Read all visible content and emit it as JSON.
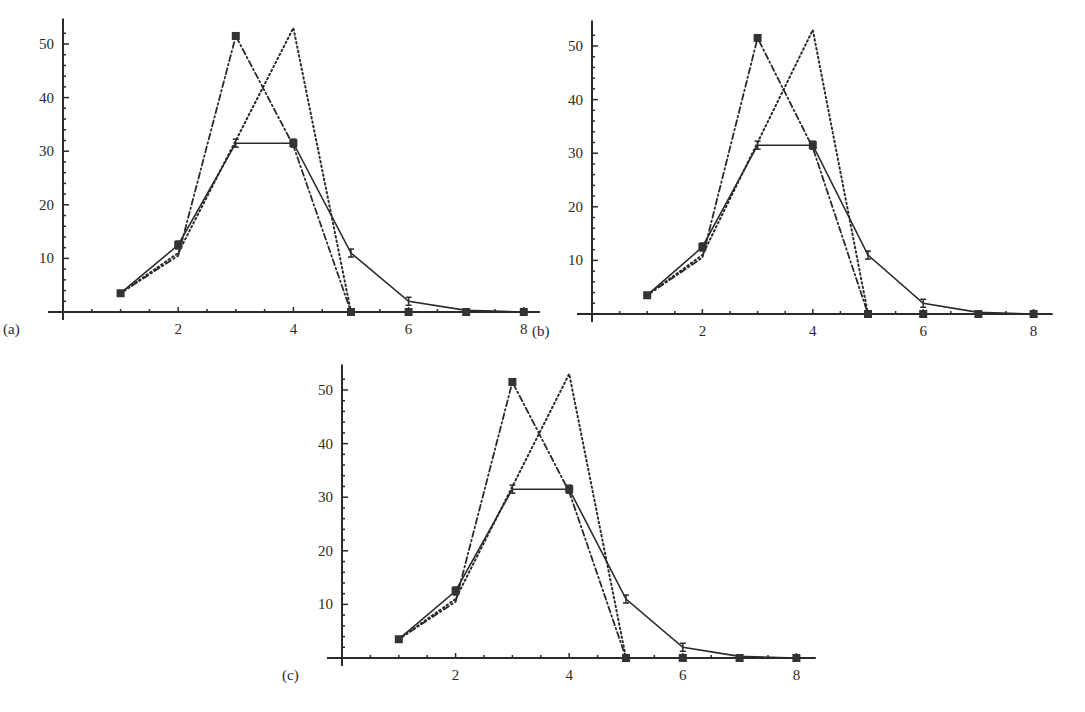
{
  "figure": {
    "panels": [
      {
        "id": "a",
        "label": "(a)"
      },
      {
        "id": "b",
        "label": "(b)"
      },
      {
        "id": "c",
        "label": "(c)"
      }
    ]
  },
  "chart_data": [
    {
      "type": "line",
      "panel_label": "(a)",
      "title": "",
      "xlabel": "",
      "ylabel": "",
      "x_ticks": [
        2,
        4,
        6,
        8
      ],
      "y_ticks": [
        10,
        20,
        30,
        40,
        50
      ],
      "xlim": [
        0,
        8.2
      ],
      "ylim": [
        0,
        54
      ],
      "grid": false,
      "legend": null,
      "series": [
        {
          "name": "solid-with-error-bars",
          "style": "solid",
          "x": [
            1,
            2,
            3,
            4,
            5,
            6,
            7,
            8
          ],
          "values": [
            3.5,
            12.5,
            31.5,
            31.5,
            11,
            2,
            0.3,
            0
          ]
        },
        {
          "name": "dash-dot",
          "style": "dash-dot",
          "x": [
            1,
            2,
            3,
            4,
            5,
            6,
            7,
            8
          ],
          "values": [
            3.5,
            10.5,
            51.5,
            31,
            0,
            0,
            0,
            0
          ]
        },
        {
          "name": "dotted",
          "style": "dotted",
          "x": [
            1,
            2,
            3,
            4,
            5,
            6,
            7,
            8
          ],
          "values": [
            3.5,
            11,
            32,
            53,
            0,
            0,
            0,
            0
          ]
        }
      ]
    },
    {
      "type": "line",
      "panel_label": "(b)",
      "title": "",
      "xlabel": "",
      "ylabel": "",
      "x_ticks": [
        2,
        4,
        6,
        8
      ],
      "y_ticks": [
        10,
        20,
        30,
        40,
        50
      ],
      "xlim": [
        0,
        8.2
      ],
      "ylim": [
        0,
        54
      ],
      "grid": false,
      "legend": null,
      "series": [
        {
          "name": "solid-with-error-bars",
          "style": "solid",
          "x": [
            1,
            2,
            3,
            4,
            5,
            6,
            7,
            8
          ],
          "values": [
            3.5,
            12.5,
            31.5,
            31.5,
            11,
            2,
            0.3,
            0
          ]
        },
        {
          "name": "dash-dot",
          "style": "dash-dot",
          "x": [
            1,
            2,
            3,
            4,
            5,
            6,
            7,
            8
          ],
          "values": [
            3.5,
            10.5,
            51.5,
            31,
            0,
            0,
            0,
            0
          ]
        },
        {
          "name": "dotted",
          "style": "dotted",
          "x": [
            1,
            2,
            3,
            4,
            5,
            6,
            7,
            8
          ],
          "values": [
            3.5,
            11,
            32,
            53,
            0,
            0,
            0,
            0
          ]
        }
      ]
    },
    {
      "type": "line",
      "panel_label": "(c)",
      "title": "",
      "xlabel": "",
      "ylabel": "",
      "x_ticks": [
        2,
        4,
        6,
        8
      ],
      "y_ticks": [
        10,
        20,
        30,
        40,
        50
      ],
      "xlim": [
        0,
        8.2
      ],
      "ylim": [
        0,
        54
      ],
      "grid": false,
      "legend": null,
      "series": [
        {
          "name": "solid-with-error-bars",
          "style": "solid",
          "x": [
            1,
            2,
            3,
            4,
            5,
            6,
            7,
            8
          ],
          "values": [
            3.5,
            12.5,
            31.5,
            31.5,
            11,
            2,
            0.3,
            0
          ]
        },
        {
          "name": "dash-dot",
          "style": "dash-dot",
          "x": [
            1,
            2,
            3,
            4,
            5,
            6,
            7,
            8
          ],
          "values": [
            3.5,
            10.5,
            51.5,
            31,
            0,
            0,
            0,
            0
          ]
        },
        {
          "name": "dotted",
          "style": "dotted",
          "x": [
            1,
            2,
            3,
            4,
            5,
            6,
            7,
            8
          ],
          "values": [
            3.5,
            11,
            32,
            53,
            0,
            0,
            0,
            0
          ]
        }
      ]
    }
  ]
}
